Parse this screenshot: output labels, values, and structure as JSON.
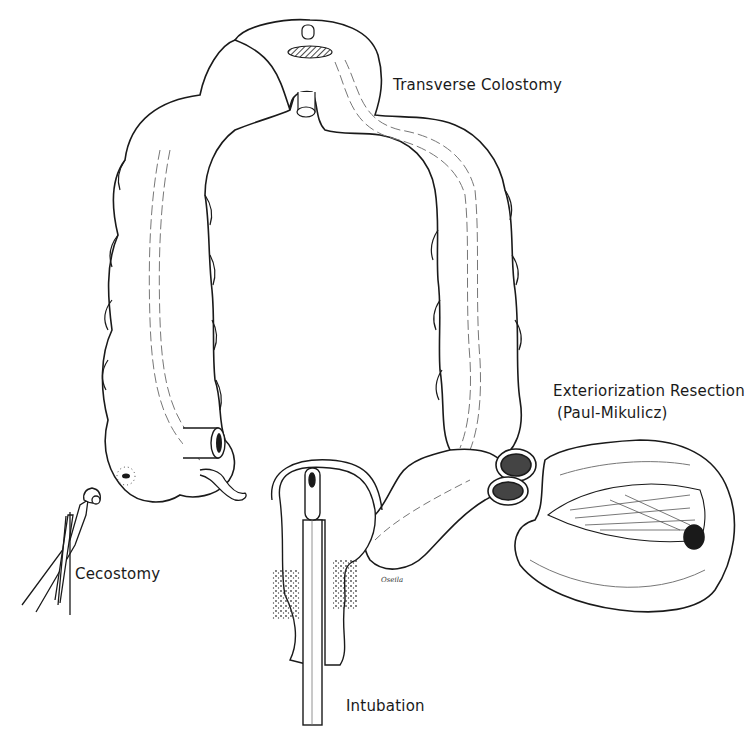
{
  "figure": {
    "colors": {
      "ink": "#1a1a1a",
      "background": "#ffffff",
      "shading": "#555555"
    },
    "labels": {
      "transverse_colostomy": "Transverse Colostomy",
      "exteriorization_line1": "Exteriorization Resection",
      "exteriorization_line2": "(Paul-Mikulicz)",
      "cecostomy": "Cecostomy",
      "intubation": "Intubation"
    },
    "signature": "Oseila"
  }
}
